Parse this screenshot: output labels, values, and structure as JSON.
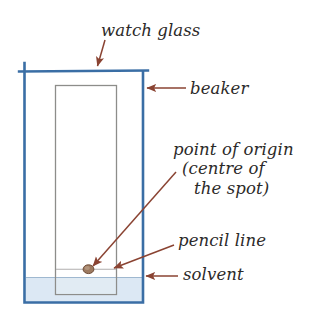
{
  "diagram": {
    "labels": {
      "watch_glass": "watch glass",
      "beaker": "beaker",
      "point_of_origin_line1": "point of origin",
      "point_of_origin_line2": "(centre of",
      "point_of_origin_line3": "the spot)",
      "pencil_line": "pencil line",
      "solvent": "solvent"
    },
    "colors": {
      "beaker_glass": "#3a6ea5",
      "watch_glass": "#3a6ea5",
      "solvent_fill": "#dce8f4",
      "solvent_edge": "#9fb8d0",
      "chromatography_paper_edge": "#8d8d8a",
      "chromatography_paper_fill": "#ffffff",
      "pencil_line": "#b0aeae",
      "spot": "#8d6a52",
      "annotation_arrow": "#8a4332",
      "label_text": "#2c2a29",
      "background": "#ffffff"
    },
    "parts": [
      "watch glass",
      "beaker",
      "chromatography paper",
      "pencil line",
      "point of origin spot",
      "solvent"
    ]
  }
}
